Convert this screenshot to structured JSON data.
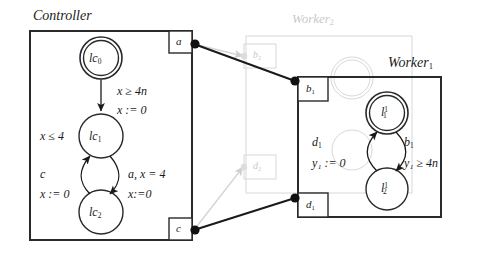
{
  "diagram": {
    "kind": "timed-automata-network",
    "colors": {
      "ink": "#1a1a1a",
      "faded": "#c9c9c9",
      "paper": "#ffffff"
    }
  },
  "controller": {
    "title": "Controller",
    "ports": [
      {
        "id": "a",
        "label": "a"
      },
      {
        "id": "c",
        "label": "c"
      }
    ],
    "states": [
      {
        "id": "lc0",
        "name": "lc",
        "index": "0",
        "initial": true
      },
      {
        "id": "lc1",
        "name": "lc",
        "index": "1",
        "initial": false
      },
      {
        "id": "lc2",
        "name": "lc",
        "index": "2",
        "initial": false
      }
    ],
    "invariant": "x ≤ 4",
    "transitions": [
      {
        "from": "lc0",
        "to": "lc1",
        "guard": "x ≥ 4n",
        "update": "x := 0"
      },
      {
        "from": "lc1",
        "to": "lc2",
        "guard": "a, x = 4",
        "update": "x:=0"
      },
      {
        "from": "lc2",
        "to": "lc1",
        "guard": "c",
        "update": "x := 0"
      }
    ]
  },
  "worker1": {
    "title": "Worker",
    "title_index": "1",
    "ports": [
      {
        "id": "b1",
        "label": "b",
        "index": "1"
      },
      {
        "id": "d1",
        "label": "d",
        "index": "1"
      }
    ],
    "states": [
      {
        "id": "l11",
        "name": "l",
        "sub": "1",
        "sup": "1",
        "initial": true
      },
      {
        "id": "l12",
        "name": "l",
        "sub": "2",
        "sup": "1",
        "initial": false
      }
    ],
    "transitions": [
      {
        "from": "l11",
        "to": "l12",
        "guard": "b",
        "guard_index": "1",
        "update": "y₁ ≥ 4n"
      },
      {
        "from": "l12",
        "to": "l11",
        "guard": "d",
        "guard_index": "1",
        "update": "y₁ := 0"
      }
    ],
    "labels": {
      "d1": "d",
      "d1_index": "1",
      "y1_reset": "y₁ := 0",
      "b1": "b",
      "b1_index": "1",
      "y1_guard": "y₁ ≥ 4n"
    }
  },
  "worker2_faded": {
    "title": "Worker",
    "title_index": "2",
    "ports": [
      {
        "id": "b2",
        "label": "b",
        "index": "2"
      },
      {
        "id": "d2",
        "label": "d",
        "index": "2"
      }
    ]
  },
  "connections": [
    {
      "from": "a",
      "to": "b1",
      "style": "solid"
    },
    {
      "from": "a",
      "to": "b2",
      "style": "faded"
    },
    {
      "from": "c",
      "to": "d1",
      "style": "solid"
    },
    {
      "from": "c",
      "to": "d2",
      "style": "faded"
    }
  ]
}
